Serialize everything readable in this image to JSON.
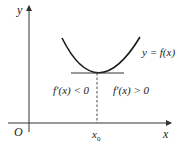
{
  "diagram": {
    "axes": {
      "x_label": "x",
      "y_label": "y",
      "origin_label": "O",
      "x0_label": "x",
      "x0_subscript": "0"
    },
    "curve": {
      "label": "y = f(x)",
      "type": "parabola-minimum"
    },
    "regions": {
      "left": "f′(x) < 0",
      "right": "f′(x) > 0"
    },
    "colors": {
      "stroke": "#1a1a1a",
      "axis": "#333333"
    }
  }
}
